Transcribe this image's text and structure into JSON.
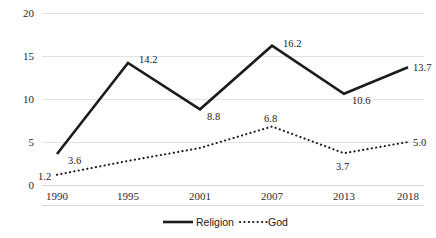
{
  "chart_data": {
    "type": "line",
    "title": "",
    "xlabel": "",
    "ylabel": "",
    "categories": [
      "1990",
      "1995",
      "2001",
      "2007",
      "2013",
      "2018"
    ],
    "ylim": [
      0,
      20
    ],
    "yticks": [
      "0",
      "5",
      "10",
      "15",
      "20"
    ],
    "grid": true,
    "legend_position": "bottom-center",
    "series": [
      {
        "name": "Religion",
        "style": "solid",
        "color": "#1c1c1c",
        "values": [
          3.6,
          14.2,
          8.8,
          16.2,
          10.6,
          13.7
        ],
        "labels": [
          "3.6",
          "14.2",
          "8.8",
          "16.2",
          "10.6",
          "13.7"
        ]
      },
      {
        "name": "God",
        "style": "dotted",
        "color": "#1c1c1c",
        "values": [
          1.2,
          2.8,
          4.3,
          6.8,
          3.7,
          5.0
        ],
        "labels": [
          "1.2",
          "",
          "",
          "6.8",
          "3.7",
          "5.0"
        ]
      }
    ]
  },
  "axis": {
    "y": {
      "t0": "0",
      "t1": "5",
      "t2": "10",
      "t3": "15",
      "t4": "20"
    },
    "x": {
      "t0": "1990",
      "t1": "1995",
      "t2": "2001",
      "t3": "2007",
      "t4": "2013",
      "t5": "2018"
    }
  },
  "labels": {
    "religion": {
      "v0": "3.6",
      "v1": "14.2",
      "v2": "8.8",
      "v3": "16.2",
      "v4": "10.6",
      "v5": "13.7"
    },
    "god": {
      "v0": "1.2",
      "v3": "6.8",
      "v4": "3.7",
      "v5": "5.0"
    }
  },
  "legend": {
    "religion_label": "Religion",
    "god_label": "God"
  }
}
